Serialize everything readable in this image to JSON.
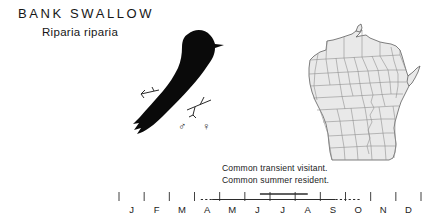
{
  "page": {
    "background": "#ffffff",
    "ink": "#161616"
  },
  "header": {
    "common_name": "BANK SWALLOW",
    "scientific_name": "Riparia riparia"
  },
  "plate": {
    "bird_illustration": "bank-swallow-silhouette",
    "perch": "twig-perch",
    "sex_symbols": {
      "male": "♂",
      "female": "♀"
    }
  },
  "map": {
    "region": "wisconsin-county-map",
    "fill_color": "#e8e8e8",
    "line_color": "#8c8c8c",
    "outline_color": "#5a5a5a"
  },
  "status": {
    "lines": [
      "Common transient visitant.",
      "Common summer resident."
    ]
  },
  "chart_data": {
    "type": "table",
    "categories": [
      "J",
      "F",
      "M",
      "A",
      "M",
      "J",
      "J",
      "A",
      "S",
      "O",
      "N",
      "D"
    ],
    "xlabel": "",
    "ylabel": "",
    "grid": false,
    "legend": "none",
    "axis_ticks": 13,
    "series": [
      {
        "name": "Common summer resident",
        "style": "solid-bar-upper",
        "start_month": 5.6,
        "end_month": 7.5
      },
      {
        "name": "Common transient visitant",
        "style": "solid-line-lower",
        "start_month": 3.7,
        "end_month": 8.6
      },
      {
        "name": "Transient extension (sparse)",
        "style": "dashed-line-lower",
        "segments": [
          {
            "start_month": 3.25,
            "end_month": 3.7
          },
          {
            "start_month": 8.6,
            "end_month": 9.6
          }
        ]
      }
    ]
  }
}
